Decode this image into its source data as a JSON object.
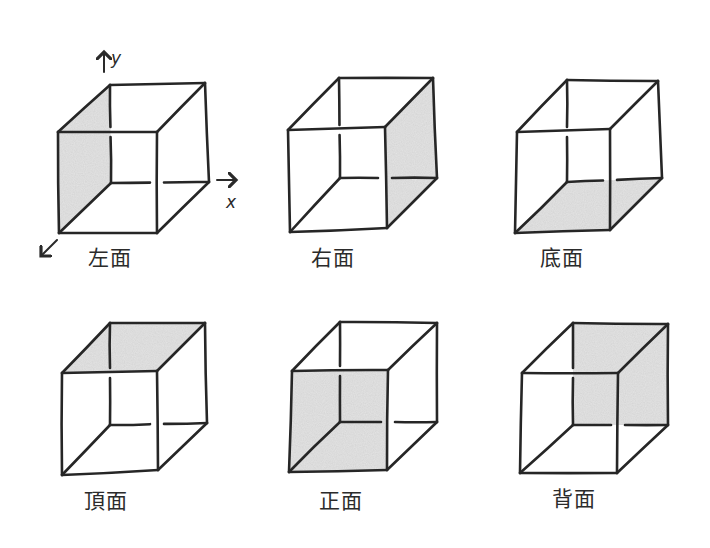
{
  "diagram": {
    "background": "#ffffff",
    "line_color": "#262626",
    "shade_color": "#d4d4d4",
    "axes": {
      "y_label": "y",
      "x_label": "x",
      "z_arrow": true
    },
    "cubes": [
      {
        "id": "left",
        "label": "左面",
        "shaded_face": "left",
        "label_pos": [
          88,
          248
        ],
        "pts": {
          "FTL": [
            58,
            132
          ],
          "FTR": [
            157,
            132
          ],
          "FBL": [
            59,
            233
          ],
          "FBR": [
            157,
            233
          ],
          "BTL": [
            110,
            85
          ],
          "BTR": [
            205,
            83
          ],
          "BBL": [
            111,
            183
          ],
          "BBR": [
            209,
            182
          ]
        }
      },
      {
        "id": "right",
        "label": "右面",
        "shaded_face": "right",
        "label_pos": [
          311,
          248
        ],
        "pts": {
          "FTL": [
            288,
            130
          ],
          "FTR": [
            385,
            127
          ],
          "FBL": [
            290,
            232
          ],
          "FBR": [
            387,
            228
          ],
          "BTL": [
            339,
            78
          ],
          "BTR": [
            433,
            78
          ],
          "BBL": [
            340,
            178
          ],
          "BBR": [
            437,
            178
          ]
        }
      },
      {
        "id": "bottom",
        "label": "底面",
        "shaded_face": "bottom",
        "label_pos": [
          540,
          248
        ],
        "pts": {
          "FTL": [
            517,
            132
          ],
          "FTR": [
            610,
            129
          ],
          "FBL": [
            515,
            233
          ],
          "FBR": [
            610,
            230
          ],
          "BTL": [
            567,
            80
          ],
          "BTR": [
            658,
            81
          ],
          "BBL": [
            567,
            182
          ],
          "BBR": [
            662,
            178
          ]
        }
      },
      {
        "id": "top",
        "label": "頂面",
        "shaded_face": "top",
        "label_pos": [
          84,
          491
        ],
        "pts": {
          "FTL": [
            62,
            373
          ],
          "FTR": [
            157,
            371
          ],
          "FBL": [
            62,
            475
          ],
          "FBR": [
            158,
            470
          ],
          "BTL": [
            110,
            323
          ],
          "BTR": [
            205,
            323
          ],
          "BBL": [
            110,
            425
          ],
          "BBR": [
            207,
            423
          ]
        }
      },
      {
        "id": "front",
        "label": "正面",
        "shaded_face": "front",
        "label_pos": [
          319,
          491
        ],
        "pts": {
          "FTL": [
            292,
            371
          ],
          "FTR": [
            388,
            370
          ],
          "FBL": [
            289,
            472
          ],
          "FBR": [
            387,
            470
          ],
          "BTL": [
            340,
            322
          ],
          "BTR": [
            437,
            323
          ],
          "BBL": [
            340,
            422
          ],
          "BBR": [
            437,
            422
          ]
        }
      },
      {
        "id": "back",
        "label": "背面",
        "shaded_face": "back",
        "label_pos": [
          552,
          489
        ],
        "pts": {
          "FTL": [
            522,
            373
          ],
          "FTR": [
            618,
            373
          ],
          "FBL": [
            520,
            473
          ],
          "FBR": [
            617,
            473
          ],
          "BTL": [
            573,
            323
          ],
          "BTR": [
            668,
            324
          ],
          "BBL": [
            573,
            425
          ],
          "BBR": [
            668,
            425
          ]
        }
      }
    ]
  }
}
